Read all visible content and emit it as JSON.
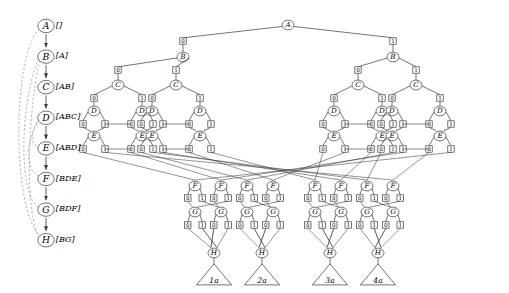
{
  "figure": {
    "kind": "binary-decision-diagram",
    "background": "#ffffff",
    "stroke": "#3a3a3a",
    "dashed_stroke": "#9a9a9a",
    "text_color": "#000000"
  },
  "variable_order": {
    "title": "",
    "nodes": [
      {
        "name": "A",
        "support": "[]"
      },
      {
        "name": "B",
        "support": "[A]"
      },
      {
        "name": "C",
        "support": "[AB]"
      },
      {
        "name": "D",
        "support": "[ABC]"
      },
      {
        "name": "E",
        "support": "[ABD]"
      },
      {
        "name": "F",
        "support": "[BDE]"
      },
      {
        "name": "G",
        "support": "[BDF]"
      },
      {
        "name": "H",
        "support": "[BG]"
      }
    ],
    "back_edges": [
      {
        "from": "A",
        "to": "H",
        "style": "dashed"
      },
      {
        "from": "B",
        "to": "G",
        "style": "dashed"
      },
      {
        "from": "B",
        "to": "H",
        "style": "dashed"
      },
      {
        "from": "D",
        "to": "E",
        "style": "dashed"
      },
      {
        "from": "D",
        "to": "F",
        "style": "dashed"
      }
    ]
  },
  "edge_labels": {
    "low": "0",
    "high": "1"
  },
  "levels": [
    {
      "var": "A",
      "count": 1
    },
    {
      "var": "B",
      "count": 2
    },
    {
      "var": "C",
      "count": 4
    },
    {
      "var": "D",
      "count": 8
    },
    {
      "var": "E",
      "count": 8
    },
    {
      "var": "F",
      "count": 8
    },
    {
      "var": "G",
      "count": 8
    },
    {
      "var": "H",
      "count": 4
    }
  ],
  "terminals": [
    {
      "label": "1a"
    },
    {
      "label": "2a"
    },
    {
      "label": "3a"
    },
    {
      "label": "4a"
    }
  ]
}
